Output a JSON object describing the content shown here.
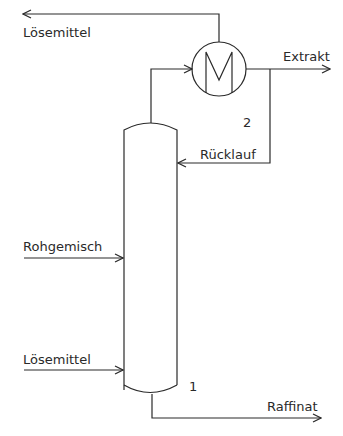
{
  "diagram": {
    "type": "process-flow",
    "labels": {
      "solvent_out": "Lösemittel",
      "extract": "Extrakt",
      "reflux": "Rücklauf",
      "feed": "Rohgemisch",
      "solvent_in": "Lösemittel",
      "raffinate": "Raffinat",
      "column_number": "1",
      "exchanger_number": "2"
    },
    "components": [
      {
        "id": "1",
        "kind": "extraction-column"
      },
      {
        "id": "2",
        "kind": "heat-exchanger"
      }
    ],
    "colors": {
      "line": "#2a2a2a",
      "background": "#ffffff"
    }
  }
}
